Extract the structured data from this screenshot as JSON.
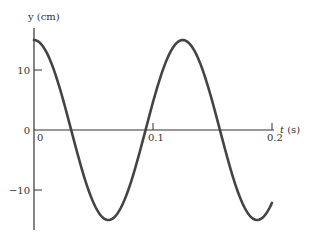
{
  "chart_data": {
    "type": "line",
    "title": "",
    "xlabel": "t (s)",
    "ylabel": "y (cm)",
    "xlabel_var": "t",
    "xlabel_unit": "(s)",
    "ylabel_var": "y",
    "ylabel_unit": "(cm)",
    "xlim": [
      0,
      0.2
    ],
    "ylim": [
      -15,
      15
    ],
    "x_ticks": [
      0,
      0.1,
      0.2
    ],
    "x_tick_labels": [
      "0",
      "0.1",
      "0.2"
    ],
    "y_ticks": [
      -10,
      0,
      10
    ],
    "y_tick_labels": [
      "-10",
      "0",
      "10"
    ],
    "grid": false,
    "legend": null,
    "series": [
      {
        "name": "y(t)",
        "function": "y = 15 cos(2π t / 0.125)",
        "amplitude_cm": 15,
        "period_s": 0.125,
        "color": "#444444",
        "x": [
          0,
          0.0156,
          0.03125,
          0.0469,
          0.0625,
          0.0781,
          0.09375,
          0.1094,
          0.125,
          0.1406,
          0.15625,
          0.1719,
          0.1875,
          0.2
        ],
        "values": [
          15,
          10.6,
          0,
          -10.6,
          -15,
          -10.6,
          0,
          10.6,
          15,
          10.6,
          0,
          -10.6,
          -15,
          -12.1
        ]
      }
    ]
  },
  "colors": {
    "curve": "#444444",
    "axis": "#333333"
  }
}
